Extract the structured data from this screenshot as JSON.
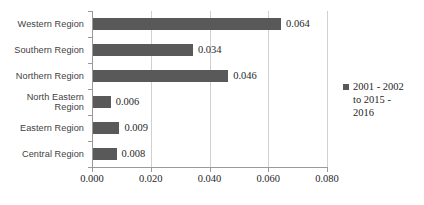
{
  "chart_data": {
    "type": "bar",
    "orientation": "horizontal",
    "title": "",
    "xlabel": "",
    "ylabel": "",
    "categories": [
      "Central Region",
      "Eastern Region",
      "North Eastern Region",
      "Northern Region",
      "Southern Region",
      "Western Region"
    ],
    "values": [
      0.008,
      0.009,
      0.006,
      0.046,
      0.034,
      0.064
    ],
    "value_labels": [
      "0.008",
      "0.009",
      "0.006",
      "0.046",
      "0.034",
      "0.064"
    ],
    "series": [
      {
        "name": "2001 - 2002 to 2015 - 2016",
        "values": [
          0.008,
          0.009,
          0.006,
          0.046,
          0.034,
          0.064
        ]
      }
    ],
    "xlim": [
      0.0,
      0.08
    ],
    "xticks": [
      0.0,
      0.02,
      0.04,
      0.06,
      0.08
    ],
    "xtick_labels": [
      "0.000",
      "0.020",
      "0.040",
      "0.060",
      "0.080"
    ],
    "grid": "vertical",
    "legend_position": "right",
    "bar_color": "#595959",
    "gridline_color": "#d0d0d0",
    "axis_color": "#9a9a9a",
    "label_color": "#3f3f3f",
    "background": "#ffffff"
  },
  "legend": {
    "entries": [
      {
        "label": "2001 - 2002\nto 2015 -\n2016",
        "color": "#595959"
      }
    ]
  }
}
